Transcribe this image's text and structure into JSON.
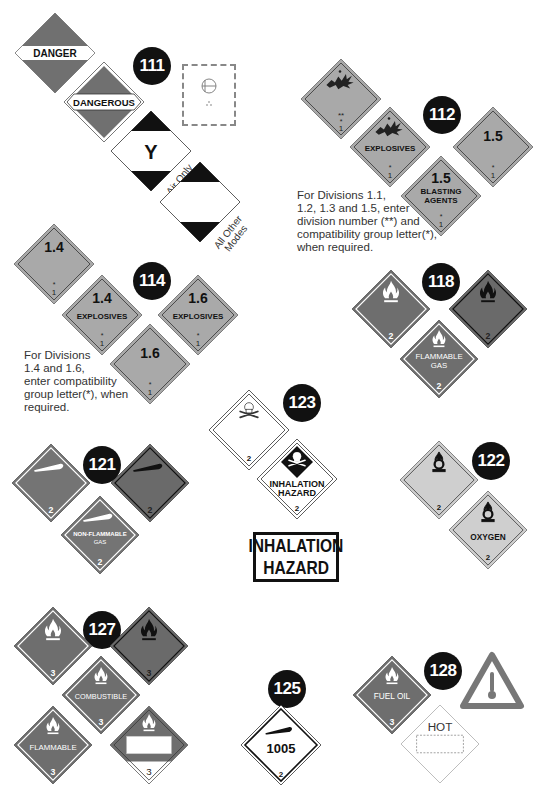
{
  "colors": {
    "dark_red_gray": "#707070",
    "flammable_red": "#6e6e6e",
    "explosive_orange": "#a9a9a9",
    "oxidizer_yellow": "#cfcfcf",
    "nonflammable_green": "#747474",
    "badge": "#111111",
    "white": "#ffffff"
  },
  "guides": [
    {
      "number": "111",
      "placards": [
        {
          "id": "danger",
          "label": "DANGER"
        },
        {
          "id": "dangerous",
          "label": "DANGEROUS"
        },
        {
          "id": "cargo-air-only",
          "letter": "Y",
          "caption": "Air Only"
        },
        {
          "id": "cargo-all-other-modes",
          "caption": "All Other Modes"
        },
        {
          "id": "radioactive-label",
          "symbol": "radioactive-label-icon"
        }
      ]
    },
    {
      "number": "112",
      "placards": [
        {
          "id": "explosive-generic",
          "division": "**",
          "compat": "*",
          "class": "1"
        },
        {
          "id": "explosives",
          "label": "EXPLOSIVES",
          "compat": "*",
          "class": "1"
        },
        {
          "id": "div-1-5",
          "division": "1.5",
          "compat": "*",
          "class": "1"
        },
        {
          "id": "blasting-agents",
          "division": "1.5",
          "label_line1": "BLASTING",
          "label_line2": "AGENTS",
          "compat": "*",
          "class": "1"
        }
      ],
      "note": [
        "For Divisions 1.1,",
        "1.2, 1.3 and 1.5, enter",
        "division number (**) and",
        "compatibility group letter(*),",
        "when required."
      ]
    },
    {
      "number": "114",
      "placards": [
        {
          "id": "div-1-4",
          "division": "1.4",
          "compat": "*",
          "class": "1"
        },
        {
          "id": "div-1-4-explosives",
          "division": "1.4",
          "label": "EXPLOSIVES",
          "compat": "*",
          "class": "1"
        },
        {
          "id": "div-1-6-explosives",
          "division": "1.6",
          "label": "EXPLOSIVES",
          "compat": "*",
          "class": "1"
        },
        {
          "id": "div-1-6",
          "division": "1.6",
          "compat": "*",
          "class": "1"
        }
      ],
      "note": [
        "For Divisions",
        "1.4 and 1.6,",
        "enter compatibility",
        "group letter(*), when",
        "required."
      ]
    },
    {
      "number": "118",
      "placards": [
        {
          "id": "flammable-gas-white",
          "class": "2"
        },
        {
          "id": "flammable-gas-black",
          "class": "2"
        },
        {
          "id": "flammable-gas-label",
          "label_line1": "FLAMMABLE",
          "label_line2": "GAS",
          "class": "2"
        }
      ]
    },
    {
      "number": "121",
      "placards": [
        {
          "id": "nonflammable-white",
          "class": "2"
        },
        {
          "id": "nonflammable-black",
          "class": "2"
        },
        {
          "id": "nonflammable-gas-label",
          "label_line1": "NON-FLAMMABLE",
          "label_line2": "GAS",
          "class": "2"
        }
      ]
    },
    {
      "number": "122",
      "placards": [
        {
          "id": "oxidizer",
          "class": "2"
        },
        {
          "id": "oxygen",
          "label": "OXYGEN",
          "class": "2"
        }
      ]
    },
    {
      "number": "123",
      "placards": [
        {
          "id": "poison-gas",
          "class": "2"
        },
        {
          "id": "inhalation-hazard-placard",
          "label_line1": "INHALATION",
          "label_line2": "HAZARD",
          "class": "2"
        }
      ],
      "sign": [
        "INHALATION",
        "HAZARD"
      ]
    },
    {
      "number": "125",
      "placards": [
        {
          "id": "un-1005",
          "un_number": "1005",
          "class": "2"
        }
      ]
    },
    {
      "number": "127",
      "placards": [
        {
          "id": "flammable-white",
          "class": "3"
        },
        {
          "id": "flammable-black",
          "class": "3"
        },
        {
          "id": "combustible",
          "label": "COMBUSTIBLE",
          "class": "3"
        },
        {
          "id": "flammable",
          "label": "FLAMMABLE",
          "class": "3"
        },
        {
          "id": "flammable-un-panel",
          "class": "3"
        }
      ]
    },
    {
      "number": "128",
      "placards": [
        {
          "id": "fuel-oil",
          "label": "FUEL OIL",
          "class": "3"
        },
        {
          "id": "elevated-temp-triangle",
          "symbol": "thermometer-icon"
        },
        {
          "id": "hot",
          "label": "HOT"
        }
      ]
    }
  ]
}
